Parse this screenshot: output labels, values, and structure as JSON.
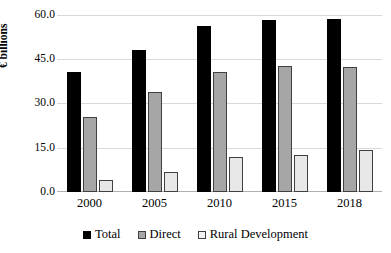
{
  "chart_data": {
    "type": "bar",
    "title": "",
    "subtitle": "",
    "xlabel": "",
    "ylabel": "€ billions",
    "categories": [
      "2000",
      "2005",
      "2010",
      "2015",
      "2018"
    ],
    "series": [
      {
        "name": "Total",
        "color": "#000000",
        "values": [
          40.7,
          48.2,
          56.3,
          58.3,
          58.5
        ]
      },
      {
        "name": "Direct",
        "color": "#a6a6a6",
        "values": [
          25.4,
          33.9,
          40.6,
          42.8,
          42.4
        ]
      },
      {
        "name": "Rural Development",
        "color": "#e8e8e8",
        "values": [
          4.1,
          6.8,
          11.8,
          12.5,
          14.2
        ]
      }
    ],
    "ylim": [
      0.0,
      75.0
    ],
    "yticks": [
      "0.0",
      "15.0",
      "30.0",
      "45.0",
      "60.0",
      "75.0"
    ],
    "ytick_values": [
      0.0,
      15.0,
      30.0,
      45.0,
      60.0,
      75.0
    ],
    "top_tick_clipped": "75.0",
    "grid": true,
    "legend_position": "bottom"
  },
  "axis": {
    "y_title": "€ billions",
    "y_ticks": [
      {
        "label": "60.0",
        "value": 60.0
      },
      {
        "label": "45.0",
        "value": 45.0
      },
      {
        "label": "30.0",
        "value": 30.0
      },
      {
        "label": "15.0",
        "value": 15.0
      },
      {
        "label": "0.0",
        "value": 0.0
      }
    ],
    "x_ticks": [
      "2000",
      "2005",
      "2010",
      "2015",
      "2018"
    ]
  },
  "legend": {
    "items": [
      {
        "label": "Total",
        "swatch": "total"
      },
      {
        "label": "Direct",
        "swatch": "direct"
      },
      {
        "label": "Rural Development",
        "swatch": "rural"
      }
    ]
  }
}
